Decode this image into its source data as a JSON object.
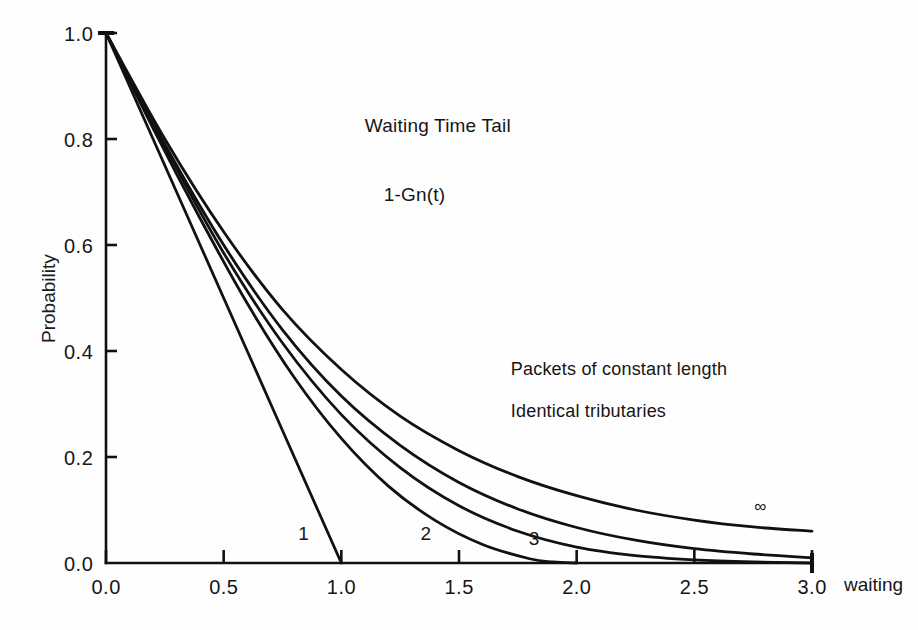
{
  "chart_data": {
    "type": "line",
    "title": "Waiting Time Tail",
    "subtitle": "1-Gn(t)",
    "xlabel": "waiting",
    "ylabel": "Probability",
    "xlim": [
      0.0,
      3.0
    ],
    "ylim": [
      0.0,
      1.0
    ],
    "xticks": [
      "0.0",
      "0.5",
      "1.0",
      "1.5",
      "2.0",
      "2.5",
      "3.0"
    ],
    "xtick_values": [
      0.0,
      0.5,
      1.0,
      1.5,
      2.0,
      2.5,
      3.0
    ],
    "yticks": [
      "0.0",
      "0.2",
      "0.4",
      "0.6",
      "0.8",
      "1.0"
    ],
    "ytick_values": [
      0.0,
      0.2,
      0.4,
      0.6,
      0.8,
      1.0
    ],
    "grid": false,
    "legend": "inline-curve-labels",
    "line_color": "#111111",
    "background": "#ffffff",
    "annotations": [
      "Packets of constant length",
      "Identical tributaries"
    ],
    "series": [
      {
        "name": "1",
        "label": "1",
        "x": [
          0.0,
          0.1,
          0.2,
          0.3,
          0.4,
          0.5,
          0.6,
          0.7,
          0.8,
          0.9,
          1.0
        ],
        "values": [
          1.0,
          0.9,
          0.8,
          0.7,
          0.6,
          0.5,
          0.4,
          0.3,
          0.2,
          0.1,
          0.0
        ]
      },
      {
        "name": "2",
        "label": "2",
        "x": [
          0.0,
          0.2,
          0.4,
          0.6,
          0.8,
          1.0,
          1.2,
          1.4,
          1.6,
          1.8,
          1.9,
          2.0
        ],
        "values": [
          1.0,
          0.82,
          0.65,
          0.49,
          0.35,
          0.235,
          0.145,
          0.08,
          0.035,
          0.008,
          0.002,
          0.0
        ]
      },
      {
        "name": "3",
        "label": "3",
        "x": [
          0.0,
          0.25,
          0.5,
          0.75,
          1.0,
          1.25,
          1.5,
          1.75,
          2.0,
          2.25,
          2.5,
          2.75,
          3.0
        ],
        "values": [
          1.0,
          0.785,
          0.585,
          0.415,
          0.28,
          0.18,
          0.108,
          0.06,
          0.03,
          0.014,
          0.006,
          0.002,
          0.0
        ]
      },
      {
        "name": "5",
        "label": "",
        "x": [
          0.0,
          0.25,
          0.5,
          0.75,
          1.0,
          1.25,
          1.5,
          1.75,
          2.0,
          2.25,
          2.5,
          2.75,
          3.0
        ],
        "values": [
          1.0,
          0.79,
          0.6,
          0.44,
          0.315,
          0.222,
          0.152,
          0.102,
          0.067,
          0.043,
          0.027,
          0.017,
          0.01
        ]
      },
      {
        "name": "infinity",
        "label": "∞",
        "x": [
          0.0,
          0.25,
          0.5,
          0.75,
          1.0,
          1.25,
          1.5,
          1.75,
          2.0,
          2.25,
          2.5,
          2.75,
          3.0
        ],
        "values": [
          1.0,
          0.8,
          0.625,
          0.478,
          0.365,
          0.277,
          0.212,
          0.163,
          0.127,
          0.1,
          0.081,
          0.068,
          0.06
        ]
      }
    ],
    "curve_labels": [
      {
        "text": "1",
        "x": 0.84,
        "y": 0.055
      },
      {
        "text": "2",
        "x": 1.36,
        "y": 0.055
      },
      {
        "text": "3",
        "x": 1.82,
        "y": 0.045
      },
      {
        "text": "∞",
        "x": 2.78,
        "y": 0.105
      }
    ],
    "title_pos": {
      "x": 1.1,
      "y": 0.845
    },
    "subtitle_pos": {
      "x": 1.18,
      "y": 0.715
    },
    "annotation_pos": [
      {
        "x": 1.72,
        "y": 0.385
      },
      {
        "x": 1.72,
        "y": 0.305
      }
    ]
  }
}
